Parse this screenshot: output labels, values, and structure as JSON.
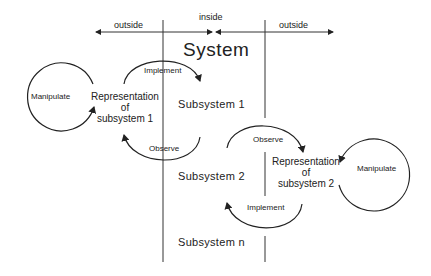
{
  "title": "System",
  "regions": {
    "left": "outside",
    "middle": "inside",
    "right": "outside"
  },
  "subsystems": [
    "Subsystem  1",
    "Subsystem  2",
    "Subsystem  n"
  ],
  "left_loop": {
    "manipulate": "Manipulate",
    "rep_line1": "Representation",
    "rep_line2": "of",
    "rep_line3": "subsystem  1",
    "implement": "Implement",
    "observe": "Observe"
  },
  "right_loop": {
    "manipulate": "Manipulate",
    "rep_line1": "Representation",
    "rep_line2": "of",
    "rep_line3": "subsystem  2",
    "implement": "Implement",
    "observe": "Observe"
  },
  "colors": {
    "line": "#222222",
    "background": "#ffffff"
  }
}
